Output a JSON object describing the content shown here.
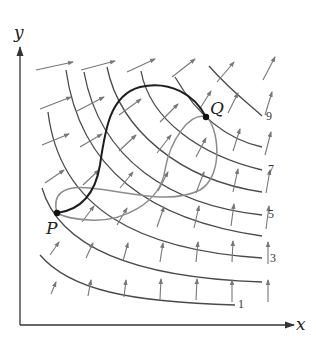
{
  "diagram": {
    "type": "vector-field-with-level-curves",
    "axes": {
      "x_label": "x",
      "y_label": "y"
    },
    "points": [
      {
        "name": "P",
        "label": "P"
      },
      {
        "name": "Q",
        "label": "Q"
      }
    ],
    "level_curve_labels": [
      "9",
      "7",
      "5",
      "3",
      "1"
    ],
    "paths": [
      {
        "name": "path-1",
        "description": "dark curve from P up and over to Q"
      },
      {
        "name": "path-2",
        "description": "gray loop curve from P to Q"
      }
    ],
    "colors": {
      "axis": "#333333",
      "level_curve": "#4a4a4a",
      "vector_arrow": "#7a7a7a",
      "dark_path": "#1e1e1e",
      "gray_path": "#8c8c8c",
      "point": "#111111"
    }
  }
}
